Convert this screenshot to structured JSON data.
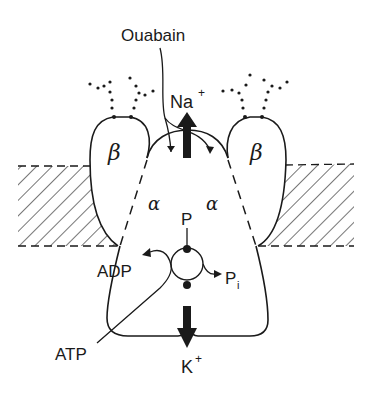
{
  "diagram": {
    "labels": {
      "ouabain": "Ouabain",
      "na": "Na",
      "na_charge": "+",
      "k": "K",
      "k_charge": "+",
      "beta_left": "β",
      "beta_right": "β",
      "alpha_left": "α",
      "alpha_right": "α",
      "phosphate": "P",
      "adp": "ADP",
      "pi": "P",
      "pi_sub": "i",
      "atp": "ATP"
    },
    "colors": {
      "ink": "#1a1a1a",
      "background": "#ffffff"
    },
    "elements": [
      "membrane-bilayer-left (hatched)",
      "membrane-bilayer-right (hatched)",
      "beta-subunit-left with glycosylation chains",
      "beta-subunit-right with glycosylation chains",
      "alpha-subunit pump body",
      "Na+ efflux arrow (up)",
      "K+ influx arrow (down)",
      "ouabain binding arrows",
      "phosphorylation cycle (ATP -> ADP + Pi)"
    ]
  }
}
